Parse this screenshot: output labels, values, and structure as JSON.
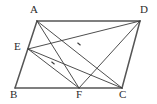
{
  "figure": {
    "kind": "geometry-diagram",
    "canvas": {
      "width": 157,
      "height": 104
    },
    "colors": {
      "stroke": "#3a3a3a",
      "outline_stroke": "#555555",
      "label": "#2b2b2b",
      "background": "#ffffff",
      "border": "#e2e2e2"
    },
    "points": [
      {
        "name": "A",
        "label": "A",
        "x": 37,
        "y": 21,
        "label_x": 30,
        "label_y": 4
      },
      {
        "name": "D",
        "label": "D",
        "x": 140,
        "y": 21,
        "label_x": 140,
        "label_y": 4
      },
      {
        "name": "E",
        "label": "E",
        "x": 28,
        "y": 49,
        "label_x": 14,
        "label_y": 41
      },
      {
        "name": "B",
        "label": "B",
        "x": 15,
        "y": 88,
        "label_x": 10,
        "label_y": 89
      },
      {
        "name": "F",
        "label": "F",
        "x": 79,
        "y": 88,
        "label_x": 76,
        "label_y": 89
      },
      {
        "name": "C",
        "label": "C",
        "x": 122,
        "y": 88,
        "label_x": 119,
        "label_y": 89
      }
    ],
    "outline_segments": [
      {
        "name": "side-AD",
        "from": "A",
        "to": "D"
      },
      {
        "name": "side-AB",
        "from": "A",
        "to": "B"
      },
      {
        "name": "side-BC",
        "from": "B",
        "to": "C"
      },
      {
        "name": "side-DC",
        "from": "D",
        "to": "C"
      }
    ],
    "inner_segments": [
      {
        "name": "segment-AF",
        "from": "A",
        "to": "F"
      },
      {
        "name": "segment-AC",
        "from": "A",
        "to": "C"
      },
      {
        "name": "segment-ED",
        "from": "E",
        "to": "D"
      },
      {
        "name": "segment-EF",
        "from": "E",
        "to": "F"
      },
      {
        "name": "segment-EC",
        "from": "E",
        "to": "C"
      },
      {
        "name": "segment-DF",
        "from": "D",
        "to": "F"
      }
    ],
    "tick_marks": [
      {
        "name": "tick-on-ED",
        "x": 79,
        "y": 44,
        "angle": 40
      },
      {
        "name": "tick-on-EC",
        "x": 53,
        "y": 63,
        "angle": 40
      }
    ]
  }
}
